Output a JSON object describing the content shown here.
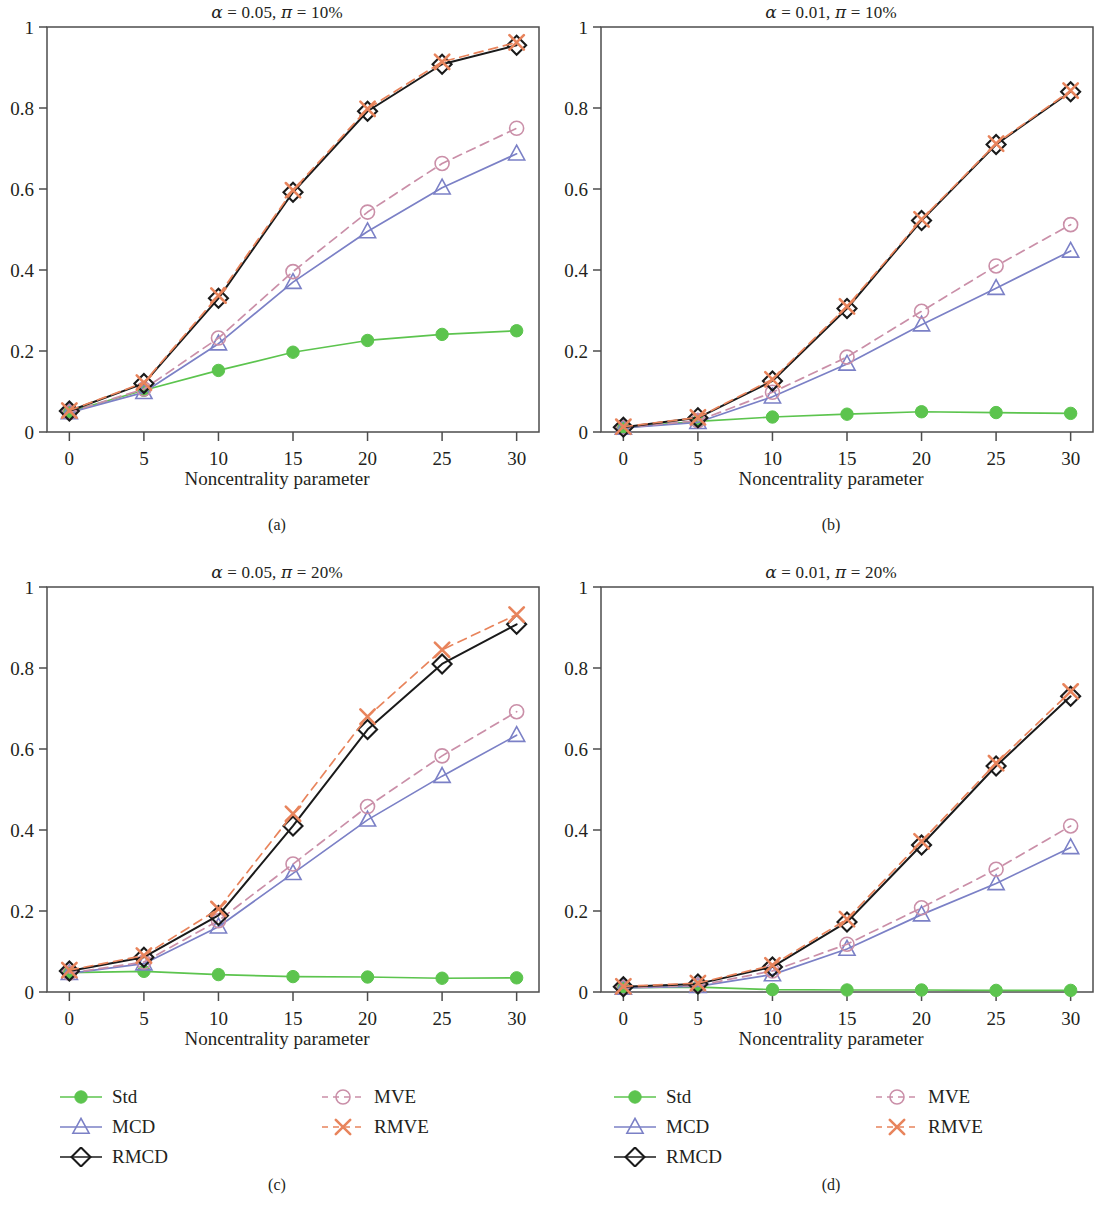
{
  "figure": {
    "panels": [
      {
        "id": "a",
        "caption": "(a)",
        "title": "α = 0.05, π = 10%",
        "xlabel": "Noncentrality parameter"
      },
      {
        "id": "b",
        "caption": "(b)",
        "title": "α = 0.01, π = 10%",
        "xlabel": "Noncentrality parameter"
      },
      {
        "id": "c",
        "caption": "(c)",
        "title": "α = 0.05, π = 20%",
        "xlabel": "Noncentrality parameter"
      },
      {
        "id": "d",
        "caption": "(d)",
        "title": "α = 0.01, π = 20%",
        "xlabel": "Noncentrality parameter"
      }
    ],
    "legend": {
      "entries": [
        {
          "label": "Std",
          "color": "#5cc44e",
          "marker": "filled-circle",
          "dash": "solid",
          "column": 1
        },
        {
          "label": "MCD",
          "color": "#7b80c6",
          "marker": "triangle",
          "dash": "solid",
          "column": 1
        },
        {
          "label": "RMCD",
          "color": "#1a1a1a",
          "marker": "diamond",
          "dash": "solid",
          "column": 1
        },
        {
          "label": "MVE",
          "color": "#ca8fa8",
          "marker": "circle",
          "dash": "dashed",
          "column": 2
        },
        {
          "label": "RMVE",
          "color": "#e8845c",
          "marker": "cross",
          "dash": "dashed",
          "column": 2
        }
      ]
    }
  },
  "chart_data": [
    {
      "type": "line",
      "panel": "a",
      "title": "α = 0.05, π = 10%",
      "xlabel": "Noncentrality parameter",
      "ylabel": "",
      "x": [
        0,
        5,
        10,
        15,
        20,
        25,
        30
      ],
      "xlim": [
        -1.5,
        31.5
      ],
      "ylim": [
        0,
        1
      ],
      "xticks": [
        0,
        5,
        10,
        15,
        20,
        25,
        30
      ],
      "yticks": [
        0,
        0.2,
        0.4,
        0.6,
        0.8,
        1
      ],
      "ytick_labels": [
        "0",
        "0.2",
        "0.4",
        "0.6",
        "0.8",
        "1"
      ],
      "grid": false,
      "legend_position": "below-figure",
      "series": [
        {
          "name": "Std",
          "values": [
            0.05,
            0.103,
            0.152,
            0.197,
            0.226,
            0.241,
            0.25
          ]
        },
        {
          "name": "MCD",
          "values": [
            0.048,
            0.098,
            0.218,
            0.37,
            0.495,
            0.603,
            0.687
          ]
        },
        {
          "name": "RMCD",
          "values": [
            0.052,
            0.12,
            0.33,
            0.592,
            0.792,
            0.908,
            0.955
          ]
        },
        {
          "name": "MVE",
          "values": [
            0.049,
            0.106,
            0.232,
            0.396,
            0.543,
            0.663,
            0.75
          ]
        },
        {
          "name": "RMVE",
          "values": [
            0.053,
            0.122,
            0.337,
            0.597,
            0.798,
            0.914,
            0.962
          ]
        }
      ]
    },
    {
      "type": "line",
      "panel": "b",
      "title": "α = 0.01, π = 10%",
      "xlabel": "Noncentrality parameter",
      "ylabel": "",
      "x": [
        0,
        5,
        10,
        15,
        20,
        25,
        30
      ],
      "xlim": [
        -1.5,
        31.5
      ],
      "ylim": [
        0,
        1
      ],
      "xticks": [
        0,
        5,
        10,
        15,
        20,
        25,
        30
      ],
      "yticks": [
        0,
        0.2,
        0.4,
        0.6,
        0.8,
        1
      ],
      "ytick_labels": [
        "0",
        "0.2",
        "0.4",
        "0.6",
        "0.8",
        "1"
      ],
      "grid": false,
      "legend_position": "below-figure",
      "series": [
        {
          "name": "Std",
          "values": [
            0.011,
            0.026,
            0.037,
            0.044,
            0.05,
            0.048,
            0.046
          ]
        },
        {
          "name": "MCD",
          "values": [
            0.01,
            0.024,
            0.087,
            0.168,
            0.265,
            0.355,
            0.447
          ]
        },
        {
          "name": "RMCD",
          "values": [
            0.012,
            0.035,
            0.126,
            0.305,
            0.522,
            0.71,
            0.84
          ]
        },
        {
          "name": "MVE",
          "values": [
            0.011,
            0.028,
            0.098,
            0.185,
            0.298,
            0.41,
            0.512
          ]
        },
        {
          "name": "RMVE",
          "values": [
            0.013,
            0.036,
            0.13,
            0.31,
            0.525,
            0.712,
            0.843
          ]
        }
      ]
    },
    {
      "type": "line",
      "panel": "c",
      "title": "α = 0.05, π = 20%",
      "xlabel": "Noncentrality parameter",
      "ylabel": "",
      "x": [
        0,
        5,
        10,
        15,
        20,
        25,
        30
      ],
      "xlim": [
        -1.5,
        31.5
      ],
      "ylim": [
        0,
        1
      ],
      "xticks": [
        0,
        5,
        10,
        15,
        20,
        25,
        30
      ],
      "yticks": [
        0,
        0.2,
        0.4,
        0.6,
        0.8,
        1
      ],
      "ytick_labels": [
        "0",
        "0.2",
        "0.4",
        "0.6",
        "0.8",
        "1"
      ],
      "grid": false,
      "legend_position": "below-figure",
      "series": [
        {
          "name": "Std",
          "values": [
            0.048,
            0.051,
            0.043,
            0.038,
            0.037,
            0.034,
            0.035
          ]
        },
        {
          "name": "MCD",
          "values": [
            0.046,
            0.07,
            0.161,
            0.293,
            0.425,
            0.533,
            0.634
          ]
        },
        {
          "name": "RMCD",
          "values": [
            0.052,
            0.086,
            0.189,
            0.41,
            0.648,
            0.81,
            0.908
          ]
        },
        {
          "name": "MVE",
          "values": [
            0.047,
            0.074,
            0.176,
            0.316,
            0.458,
            0.583,
            0.692
          ]
        },
        {
          "name": "RMVE",
          "values": [
            0.054,
            0.09,
            0.205,
            0.44,
            0.68,
            0.845,
            0.932
          ]
        }
      ]
    },
    {
      "type": "line",
      "panel": "d",
      "title": "α = 0.01, π = 20%",
      "xlabel": "Noncentrality parameter",
      "ylabel": "",
      "x": [
        0,
        5,
        10,
        15,
        20,
        25,
        30
      ],
      "xlim": [
        -1.5,
        31.5
      ],
      "ylim": [
        0,
        1
      ],
      "xticks": [
        0,
        5,
        10,
        15,
        20,
        25,
        30
      ],
      "yticks": [
        0,
        0.2,
        0.4,
        0.6,
        0.8,
        1
      ],
      "ytick_labels": [
        "0",
        "0.2",
        "0.4",
        "0.6",
        "0.8",
        "1"
      ],
      "grid": false,
      "legend_position": "below-figure",
      "series": [
        {
          "name": "Std",
          "values": [
            0.011,
            0.012,
            0.006,
            0.005,
            0.005,
            0.004,
            0.004
          ]
        },
        {
          "name": "MCD",
          "values": [
            0.01,
            0.014,
            0.043,
            0.106,
            0.191,
            0.268,
            0.357
          ]
        },
        {
          "name": "RMCD",
          "values": [
            0.013,
            0.02,
            0.062,
            0.173,
            0.363,
            0.558,
            0.73
          ]
        },
        {
          "name": "MVE",
          "values": [
            0.011,
            0.016,
            0.052,
            0.118,
            0.208,
            0.303,
            0.41
          ]
        },
        {
          "name": "RMVE",
          "values": [
            0.014,
            0.022,
            0.066,
            0.18,
            0.372,
            0.565,
            0.742
          ]
        }
      ]
    }
  ]
}
